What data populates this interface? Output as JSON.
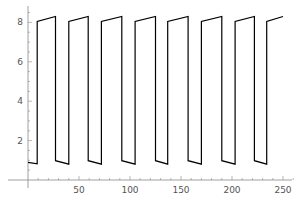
{
  "chart_data": {
    "type": "line",
    "title": "",
    "xlabel": "",
    "ylabel": "",
    "xlim": [
      0,
      252
    ],
    "ylim": [
      0,
      8.6
    ],
    "grid": false,
    "legend": null,
    "x_ticks": [
      50,
      100,
      150,
      200,
      250
    ],
    "y_ticks": [
      2,
      4,
      6,
      8
    ],
    "series": [
      {
        "name": "square-wave",
        "color": "#000000",
        "points": [
          [
            0,
            0.9
          ],
          [
            9,
            0.82
          ],
          [
            9,
            8.05
          ],
          [
            27,
            8.3
          ],
          [
            27,
            0.98
          ],
          [
            40,
            0.8
          ],
          [
            40,
            8.05
          ],
          [
            59,
            8.3
          ],
          [
            59,
            0.98
          ],
          [
            72,
            0.8
          ],
          [
            72,
            8.05
          ],
          [
            92,
            8.3
          ],
          [
            92,
            0.98
          ],
          [
            105,
            0.8
          ],
          [
            105,
            8.05
          ],
          [
            125,
            8.3
          ],
          [
            125,
            0.98
          ],
          [
            137,
            0.8
          ],
          [
            137,
            8.05
          ],
          [
            157,
            8.3
          ],
          [
            157,
            0.98
          ],
          [
            170,
            0.8
          ],
          [
            170,
            8.05
          ],
          [
            190,
            8.3
          ],
          [
            190,
            0.98
          ],
          [
            203,
            0.8
          ],
          [
            203,
            8.05
          ],
          [
            222,
            8.3
          ],
          [
            222,
            0.98
          ],
          [
            234,
            0.8
          ],
          [
            234,
            8.05
          ],
          [
            250,
            8.3
          ]
        ]
      }
    ]
  },
  "axes": {
    "x_tick_labels": [
      "50",
      "100",
      "150",
      "200",
      "250"
    ],
    "y_tick_labels": [
      "2",
      "4",
      "6",
      "8"
    ]
  }
}
